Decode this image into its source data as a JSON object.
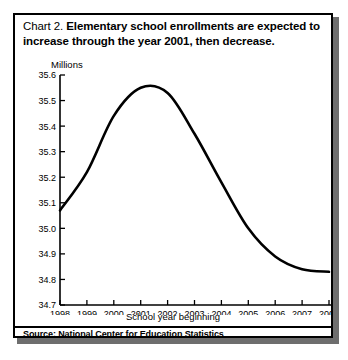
{
  "figure": {
    "title_prefix": "Chart 2.",
    "title_main_line1": "Elementary school enrollments are expected",
    "title_main_line2": "to increase through the year 2001, then decrease.",
    "units_label": "Millions",
    "source": "Source: National Center for Education Statistics",
    "frame_color": "#000000",
    "line_color": "#000000"
  },
  "chart_data": {
    "type": "line",
    "title": "Chart 2. Elementary school enrollments are expected to increase through the year 2001, then decrease.",
    "xlabel": "School year beginning",
    "ylabel": "Millions",
    "x": [
      1998,
      1999,
      2000,
      2001,
      2002,
      2003,
      2004,
      2005,
      2006,
      2007,
      2008
    ],
    "xtick_labels": [
      "1998",
      "1999",
      "2000",
      "2001",
      "2002",
      "2003",
      "2004",
      "2005",
      "2006",
      "2007",
      "2008"
    ],
    "ytick_labels": [
      "34.7",
      "34.8",
      "34.9",
      "35.0",
      "35.1",
      "35.2",
      "35.3",
      "35.4",
      "35.5",
      "35.6"
    ],
    "yticks": [
      34.7,
      34.8,
      34.9,
      35.0,
      35.1,
      35.2,
      35.3,
      35.4,
      35.5,
      35.6
    ],
    "xlim": [
      1998,
      2008
    ],
    "ylim": [
      34.7,
      35.6
    ],
    "grid": false,
    "legend": false,
    "series": [
      {
        "name": "Elementary school enrollment",
        "values": [
          35.07,
          35.22,
          35.44,
          35.55,
          35.53,
          35.37,
          35.18,
          35.0,
          34.89,
          34.84,
          34.83
        ]
      }
    ],
    "peak": {
      "x": 2001.4,
      "y": 35.57
    },
    "annotations": [],
    "source": "National Center for Education Statistics"
  }
}
